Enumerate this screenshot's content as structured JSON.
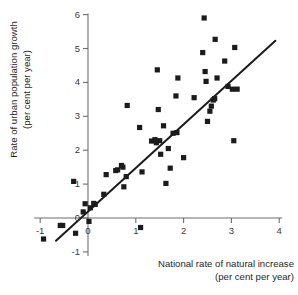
{
  "chart_data": {
    "type": "scatter",
    "title": "",
    "xlabel": "National rate of natural increase",
    "xlabel_sub": "(per cent per year)",
    "ylabel": "Rate of urban population growth",
    "ylabel_sub": "(per cent per year)",
    "xlim": [
      -1.35,
      4.25
    ],
    "ylim": [
      -1.35,
      6.3
    ],
    "xticks": [
      -1,
      0,
      1,
      2,
      3,
      4
    ],
    "xtick_labels": [
      "-1",
      "0",
      "1",
      "2",
      "3",
      "4"
    ],
    "yticks": [
      -1,
      0,
      1,
      2,
      3,
      4,
      5,
      6
    ],
    "ytick_labels": [
      "-1",
      "0",
      "1",
      "2",
      "3",
      "4",
      "5",
      "6"
    ],
    "grid": false,
    "legend": "none",
    "marker_style": "filled-square",
    "marker_color": "#1b1b1b",
    "marker_size_px": 5.2,
    "trend_line": {
      "label": "regression line",
      "color": "#1b1b1b",
      "x_start": -0.67,
      "y_start": -0.67,
      "x_end": 3.92,
      "y_end": 5.23
    },
    "points": [
      {
        "x": -0.93,
        "y": -0.62
      },
      {
        "x": -0.58,
        "y": -0.22
      },
      {
        "x": -0.53,
        "y": -0.22
      },
      {
        "x": -0.26,
        "y": -0.45
      },
      {
        "x": -0.3,
        "y": 1.08
      },
      {
        "x": -0.1,
        "y": 0.18
      },
      {
        "x": -0.06,
        "y": 0.42
      },
      {
        "x": 0.02,
        "y": -0.1
      },
      {
        "x": 0.05,
        "y": 0.3
      },
      {
        "x": 0.12,
        "y": 0.43
      },
      {
        "x": 0.15,
        "y": 0.4
      },
      {
        "x": 0.33,
        "y": 0.7
      },
      {
        "x": 0.38,
        "y": 1.28
      },
      {
        "x": 0.58,
        "y": 1.4
      },
      {
        "x": 0.62,
        "y": 1.42
      },
      {
        "x": 0.7,
        "y": 1.55
      },
      {
        "x": 0.73,
        "y": 1.5
      },
      {
        "x": 0.75,
        "y": 0.92
      },
      {
        "x": 0.8,
        "y": 1.22
      },
      {
        "x": 0.82,
        "y": 3.32
      },
      {
        "x": 1.08,
        "y": 2.67
      },
      {
        "x": 1.1,
        "y": -0.28
      },
      {
        "x": 1.13,
        "y": 1.36
      },
      {
        "x": 1.33,
        "y": 2.27
      },
      {
        "x": 1.4,
        "y": 2.31
      },
      {
        "x": 1.43,
        "y": 2.22
      },
      {
        "x": 1.45,
        "y": 4.37
      },
      {
        "x": 1.47,
        "y": 3.2
      },
      {
        "x": 1.5,
        "y": 2.28
      },
      {
        "x": 1.52,
        "y": 1.88
      },
      {
        "x": 1.58,
        "y": 2.72
      },
      {
        "x": 1.63,
        "y": 1.02
      },
      {
        "x": 1.68,
        "y": 2.05
      },
      {
        "x": 1.72,
        "y": 1.47
      },
      {
        "x": 1.78,
        "y": 2.5
      },
      {
        "x": 1.84,
        "y": 3.6
      },
      {
        "x": 1.86,
        "y": 2.52
      },
      {
        "x": 1.88,
        "y": 4.13
      },
      {
        "x": 2.0,
        "y": 1.78
      },
      {
        "x": 2.22,
        "y": 3.55
      },
      {
        "x": 2.4,
        "y": 4.88
      },
      {
        "x": 2.43,
        "y": 5.9
      },
      {
        "x": 2.45,
        "y": 4.32
      },
      {
        "x": 2.47,
        "y": 4.03
      },
      {
        "x": 2.5,
        "y": 2.85
      },
      {
        "x": 2.55,
        "y": 3.15
      },
      {
        "x": 2.58,
        "y": 3.3
      },
      {
        "x": 2.62,
        "y": 3.48
      },
      {
        "x": 2.65,
        "y": 3.52
      },
      {
        "x": 2.66,
        "y": 5.27
      },
      {
        "x": 2.7,
        "y": 4.13
      },
      {
        "x": 2.86,
        "y": 4.63
      },
      {
        "x": 2.93,
        "y": 3.88
      },
      {
        "x": 3.02,
        "y": 3.8
      },
      {
        "x": 3.05,
        "y": 2.28
      },
      {
        "x": 3.07,
        "y": 5.03
      },
      {
        "x": 3.12,
        "y": 3.8
      }
    ]
  }
}
